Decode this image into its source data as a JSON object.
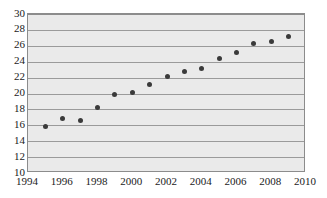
{
  "chart_data": {
    "type": "scatter",
    "title": "",
    "subtitle": "",
    "xlabel": "",
    "ylabel": "",
    "xlim": [
      1994,
      2010
    ],
    "ylim": [
      10,
      30
    ],
    "xticks": [
      1994,
      1996,
      1998,
      2000,
      2002,
      2004,
      2006,
      2008,
      2010
    ],
    "yticks": [
      10,
      12,
      14,
      16,
      18,
      20,
      22,
      24,
      26,
      28,
      30
    ],
    "xtick_labels": [
      "1994",
      "1996",
      "1998",
      "2000",
      "2002",
      "2004",
      "2006",
      "2008",
      "2010"
    ],
    "ytick_labels": [
      "10",
      "12",
      "14",
      "16",
      "18",
      "20",
      "22",
      "24",
      "26",
      "28",
      "30"
    ],
    "grid": "horizontal",
    "legend": "none",
    "legend_entries": [],
    "annotations": [],
    "marker": "filled-circle",
    "marker_color": "#3a3a3a",
    "plot_background_color": "#eaeaea",
    "gridline_color": "#9a9a9a",
    "axis_color": "#8c8c8c",
    "x": [
      1995,
      1996,
      1997,
      1998,
      1999,
      2000,
      2001,
      2002,
      2003,
      2004,
      2005,
      2006,
      2007,
      2008,
      2009
    ],
    "values": [
      15.9,
      16.8,
      16.6,
      18.3,
      19.9,
      20.1,
      21.1,
      22.2,
      22.8,
      23.2,
      24.4,
      25.2,
      26.3,
      26.6,
      27.2
    ],
    "points": [
      {
        "x": 1995,
        "y": 15.9
      },
      {
        "x": 1996,
        "y": 16.8
      },
      {
        "x": 1997,
        "y": 16.6
      },
      {
        "x": 1998,
        "y": 18.3
      },
      {
        "x": 1999,
        "y": 19.9
      },
      {
        "x": 2000,
        "y": 20.1
      },
      {
        "x": 2001,
        "y": 21.1
      },
      {
        "x": 2002,
        "y": 22.2
      },
      {
        "x": 2003,
        "y": 22.8
      },
      {
        "x": 2004,
        "y": 23.2
      },
      {
        "x": 2005,
        "y": 24.4
      },
      {
        "x": 2006,
        "y": 25.2
      },
      {
        "x": 2007,
        "y": 26.3
      },
      {
        "x": 2008,
        "y": 26.6
      },
      {
        "x": 2009,
        "y": 27.2
      }
    ]
  }
}
